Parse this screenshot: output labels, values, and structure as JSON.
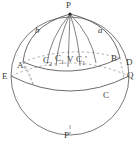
{
  "figure": {
    "kind": "sphere-geometry-diagram",
    "background_color": "#ffffff",
    "stroke_color": "#5a5a5a",
    "label_color": "#3a3a3a"
  },
  "labels": {
    "pole_top": "P",
    "pole_bottom_letter": "P",
    "pole_bottom_prime": "′",
    "point_a": "A",
    "point_b": "B",
    "point_d": "D",
    "point_e": "E",
    "point_q": "Q",
    "point_c": "C",
    "point_v": "V",
    "point_c2_letter": "C",
    "point_c2_sub": "2",
    "point_c1_letter": "C",
    "point_c1_sub": "1",
    "point_c1p_letter": "C",
    "point_c1p_sub": "1",
    "point_c1p_prime": "′",
    "arc_label_left": "b",
    "arc_label_right": "a"
  }
}
